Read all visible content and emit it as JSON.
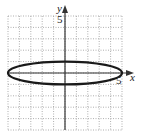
{
  "chart_data": {
    "type": "line",
    "title": "",
    "xlabel": "x",
    "ylabel": "y",
    "xlim": [
      -5,
      5
    ],
    "ylim": [
      -5,
      5
    ],
    "grid": true,
    "tick_labels": {
      "x": "5",
      "y": "5"
    },
    "series": [
      {
        "name": "ellipse",
        "equation": "x^2/25 + y^2/1 = 1",
        "center": [
          0,
          0
        ],
        "semi_axis_x": 5,
        "semi_axis_y": 1
      }
    ],
    "colors": {
      "curve": "#1a1a1a",
      "axis": "#333333",
      "grid": "#9a9a9a"
    }
  },
  "labels": {
    "x_axis": "x",
    "y_axis": "y",
    "x_tick": "5",
    "y_tick": "5"
  }
}
